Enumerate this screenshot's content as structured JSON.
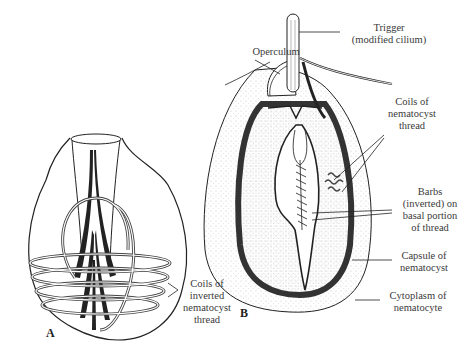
{
  "figure": {
    "panel_a": {
      "letter": "A",
      "labels": {
        "coils_inverted": [
          "Coils of",
          "inverted",
          "nematocyst",
          "thread"
        ]
      }
    },
    "panel_b": {
      "letter": "B",
      "labels": {
        "trigger": [
          "Trigger",
          "(modified cilium)"
        ],
        "operculum": [
          "Operculum"
        ],
        "coils": [
          "Coils of",
          "nematocyst",
          "thread"
        ],
        "barbs": [
          "Barbs",
          "(inverted) on",
          "basal portion",
          "of thread"
        ],
        "capsule": [
          "Capsule of",
          "nematocyst"
        ],
        "cytoplasm": [
          "Cytoplasm of",
          "nematocyte"
        ]
      }
    },
    "colors": {
      "ink": "#222222",
      "thread_dark": "#444444",
      "stipple": "#bbbbbb",
      "background": "#ffffff"
    }
  }
}
